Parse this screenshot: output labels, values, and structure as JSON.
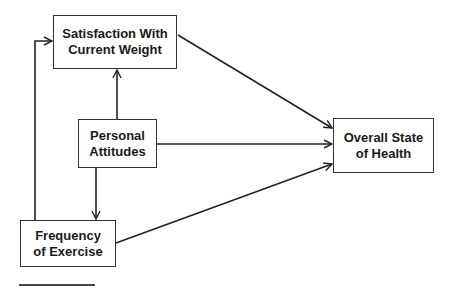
{
  "diagram": {
    "type": "path-diagram",
    "nodes": [
      {
        "id": "satisfaction",
        "label": "Satisfaction With\nCurrent Weight"
      },
      {
        "id": "attitudes",
        "label": "Personal\nAttitudes"
      },
      {
        "id": "exercise",
        "label": "Frequency\nof Exercise"
      },
      {
        "id": "health",
        "label": "Overall State\nof Health"
      }
    ],
    "edges": [
      {
        "from": "attitudes",
        "to": "satisfaction"
      },
      {
        "from": "attitudes",
        "to": "exercise"
      },
      {
        "from": "attitudes",
        "to": "health"
      },
      {
        "from": "satisfaction",
        "to": "health"
      },
      {
        "from": "exercise",
        "to": "health"
      },
      {
        "from": "exercise",
        "to": "satisfaction"
      }
    ],
    "colors": {
      "line": "#222222",
      "box_border": "#333333",
      "text": "#1a1a1a"
    }
  }
}
